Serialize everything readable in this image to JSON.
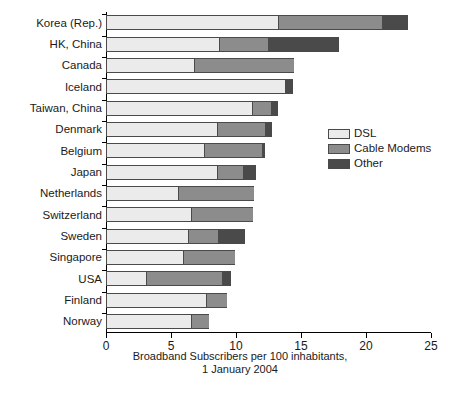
{
  "chart_data": {
    "type": "bar",
    "orientation": "horizontal",
    "stacked": true,
    "title": "",
    "xlabel": "Broadband Subscribers per 100 inhabitants,\n1 January 2004",
    "ylabel": "",
    "xlim": [
      0,
      25
    ],
    "xticks": [
      0,
      5,
      10,
      15,
      20,
      25
    ],
    "grid": false,
    "legend_position": "right-middle",
    "categories": [
      "Korea (Rep.)",
      "HK, China",
      "Canada",
      "Iceland",
      "Taiwan, China",
      "Denmark",
      "Belgium",
      "Japan",
      "Netherlands",
      "Switzerland",
      "Sweden",
      "Singapore",
      "USA",
      "Finland",
      "Norway"
    ],
    "series": [
      {
        "name": "DSL",
        "color": "#ebebeb",
        "values": [
          13.2,
          8.7,
          6.8,
          13.8,
          11.2,
          8.5,
          7.5,
          8.5,
          5.5,
          6.5,
          6.3,
          5.9,
          3.1,
          7.7,
          6.5
        ]
      },
      {
        "name": "Cable Modems",
        "color": "#8c8c8c",
        "values": [
          8.0,
          3.8,
          7.7,
          0.0,
          1.5,
          3.7,
          4.5,
          2.0,
          5.9,
          4.8,
          2.3,
          4.0,
          5.8,
          1.6,
          1.4
        ]
      },
      {
        "name": "Other",
        "color": "#4a4a4a",
        "values": [
          2.0,
          5.4,
          0.0,
          0.6,
          0.5,
          0.6,
          0.2,
          1.0,
          0.0,
          0.0,
          2.1,
          0.0,
          0.7,
          0.0,
          0.0
        ]
      }
    ],
    "totals": [
      23.2,
      17.9,
      14.5,
      14.4,
      13.2,
      12.8,
      12.2,
      11.5,
      11.4,
      11.3,
      10.7,
      9.9,
      9.6,
      9.3,
      7.9
    ]
  },
  "legend": {
    "items": [
      {
        "label": "DSL"
      },
      {
        "label": "Cable Modems"
      },
      {
        "label": "Other"
      }
    ]
  },
  "axis": {
    "x_tick_labels": [
      "0",
      "5",
      "10",
      "15",
      "20",
      "25"
    ],
    "title_line1": "Broadband Subscribers per 100 inhabitants,",
    "title_line2": "1 January 2004"
  }
}
